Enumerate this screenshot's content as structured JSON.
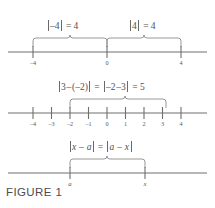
{
  "figure": {
    "caption": "FIGURE 1",
    "colors": {
      "background": "#ffffff",
      "line": "#6e6e6e",
      "brace": "#8c8c8c",
      "text": "#4f4f4f",
      "caption_text": "#4d4d4d"
    },
    "panels": [
      {
        "id": "panel-abs-four",
        "expressions": [
          {
            "id": "expr-abs-neg-four",
            "text": "|-4| = 4",
            "parts": [
              {
                "type": "bar"
              },
              {
                "type": "text",
                "value": "–4"
              },
              {
                "type": "bar"
              },
              {
                "type": "text",
                "value": " = 4"
              }
            ]
          },
          {
            "id": "expr-abs-four",
            "text": "|4| = 4",
            "parts": [
              {
                "type": "bar"
              },
              {
                "type": "text",
                "value": "4"
              },
              {
                "type": "bar"
              },
              {
                "type": "text",
                "value": " = 4"
              }
            ]
          }
        ],
        "axis": {
          "ticks": [
            {
              "value": -4,
              "label": "–4"
            },
            {
              "value": 0,
              "label": "0"
            },
            {
              "value": 4,
              "label": "4"
            }
          ],
          "range": [
            -5.2,
            5.2
          ]
        },
        "braces": [
          {
            "id": "brace-neg-four-to-zero",
            "from": -4,
            "to": 0
          },
          {
            "id": "brace-zero-to-four",
            "from": 0,
            "to": 4
          }
        ]
      },
      {
        "id": "panel-distance-three-negtwo",
        "expressions": [
          {
            "id": "expr-distance",
            "text": "|3 - (-2)| = |-2 - 3| = 5",
            "parts": [
              {
                "type": "bar"
              },
              {
                "type": "text",
                "value": "3 – (–2)"
              },
              {
                "type": "bar"
              },
              {
                "type": "text",
                "value": " = "
              },
              {
                "type": "bar"
              },
              {
                "type": "text",
                "value": "–2 –3"
              },
              {
                "type": "bar"
              },
              {
                "type": "text",
                "value": " = 5"
              }
            ]
          }
        ],
        "axis": {
          "ticks": [
            {
              "value": -4,
              "label": "–4"
            },
            {
              "value": -3,
              "label": "–3"
            },
            {
              "value": -2,
              "label": "–2"
            },
            {
              "value": -1,
              "label": "–1"
            },
            {
              "value": 0,
              "label": "0"
            },
            {
              "value": 1,
              "label": "1"
            },
            {
              "value": 2,
              "label": "2"
            },
            {
              "value": 3,
              "label": "3"
            },
            {
              "value": 4,
              "label": "4"
            }
          ],
          "range": [
            -5.2,
            5.2
          ]
        },
        "braces": [
          {
            "id": "brace-negtwo-to-three",
            "from": -2,
            "to": 3
          }
        ]
      },
      {
        "id": "panel-abs-x-minus-a",
        "expressions": [
          {
            "id": "expr-abs-x-minus-a",
            "text": "|x - a| = |a - x|",
            "parts": [
              {
                "type": "bar"
              },
              {
                "type": "italic",
                "value": "x"
              },
              {
                "type": "text",
                "value": " – "
              },
              {
                "type": "italic",
                "value": "a"
              },
              {
                "type": "bar"
              },
              {
                "type": "text",
                "value": " = "
              },
              {
                "type": "bar"
              },
              {
                "type": "italic",
                "value": "a"
              },
              {
                "type": "text",
                "value": " – "
              },
              {
                "type": "italic",
                "value": "x"
              },
              {
                "type": "bar"
              }
            ]
          }
        ],
        "axis": {
          "ticks": [
            {
              "value": -1.1,
              "label": "a",
              "italic": true
            },
            {
              "value": 2.0,
              "label": "x",
              "italic": true
            }
          ],
          "range": [
            -5.2,
            5.2
          ]
        },
        "braces": [
          {
            "id": "brace-a-to-x",
            "from": -1.1,
            "to": 2.0
          }
        ]
      }
    ]
  }
}
